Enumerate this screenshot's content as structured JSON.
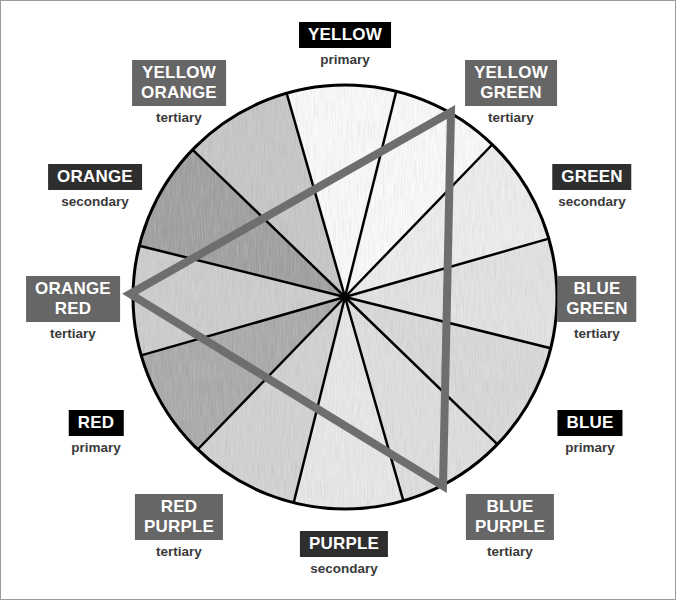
{
  "diagram": {
    "wheel": {
      "center": [
        345,
        297
      ],
      "radius": 212,
      "segment_count": 12,
      "highlight_triangle": {
        "description": "Primary color triad",
        "vertices": [
          "YELLOW GREEN",
          "ORANGE RED",
          "BLUE PURPLE"
        ],
        "color": "#6e6e6e"
      }
    },
    "colors": [
      {
        "name": "YELLOW",
        "type": "primary",
        "shade": "#ffffff"
      },
      {
        "name": "YELLOW\nGREEN",
        "type": "tertiary",
        "shade": "#ffffff"
      },
      {
        "name": "GREEN",
        "type": "secondary",
        "shade": "#f2f2f2"
      },
      {
        "name": "BLUE\nGREEN",
        "type": "tertiary",
        "shade": "#e6e6e6"
      },
      {
        "name": "BLUE",
        "type": "primary",
        "shade": "#dcdcdc"
      },
      {
        "name": "BLUE\nPURPLE",
        "type": "tertiary",
        "shade": "#e2e2e2"
      },
      {
        "name": "PURPLE",
        "type": "secondary",
        "shade": "#ececec"
      },
      {
        "name": "RED\nPURPLE",
        "type": "tertiary",
        "shade": "#d4d4d4"
      },
      {
        "name": "RED",
        "type": "primary",
        "shade": "#a8a8a8"
      },
      {
        "name": "ORANGE\nRED",
        "type": "tertiary",
        "shade": "#cfcfcf"
      },
      {
        "name": "ORANGE",
        "type": "secondary",
        "shade": "#9c9c9c"
      },
      {
        "name": "YELLOW\nORANGE",
        "type": "tertiary",
        "shade": "#c8c8c8"
      }
    ],
    "legend_colors": {
      "primary_box": "#000000",
      "secondary_box": "#2e2e2e",
      "tertiary_box": "#666666",
      "triangle": "#6e6e6e"
    }
  }
}
